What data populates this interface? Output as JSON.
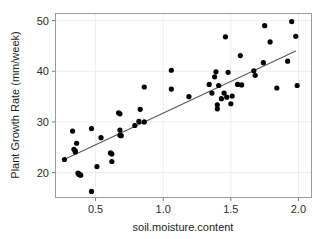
{
  "chart_data": {
    "type": "scatter",
    "title": "",
    "xlabel": "soil.moisture.content",
    "ylabel": "Plant Growth Rate (mm/week)",
    "xlim": [
      0.2,
      2.1
    ],
    "ylim": [
      15.0,
      51.5
    ],
    "xticks": [
      0.5,
      1.0,
      1.5,
      2.0
    ],
    "xtick_labels": [
      "0.5",
      "1.0",
      "1.5",
      "2.0"
    ],
    "yticks": [
      20,
      30,
      40,
      50
    ],
    "ytick_labels": [
      "20",
      "30",
      "40",
      "50"
    ],
    "grid": true,
    "legend": "none",
    "point_color": "#000000",
    "point_size": 2.6,
    "line_color": "#595959",
    "line_width": 1.1,
    "panel_border_color": "#9a9a9a",
    "grid_color": "#ededed",
    "background": "#ffffff",
    "series": [
      {
        "name": "observations",
        "x": [
          0.27,
          0.33,
          0.34,
          0.35,
          0.35,
          0.36,
          0.37,
          0.38,
          0.38,
          0.39,
          0.47,
          0.47,
          0.51,
          0.54,
          0.61,
          0.62,
          0.62,
          0.67,
          0.68,
          0.68,
          0.68,
          0.69,
          0.79,
          0.82,
          0.83,
          0.86,
          0.86,
          1.06,
          1.06,
          1.19,
          1.34,
          1.36,
          1.38,
          1.39,
          1.4,
          1.4,
          1.41,
          1.43,
          1.45,
          1.46,
          1.47,
          1.48,
          1.5,
          1.51,
          1.55,
          1.57,
          1.58,
          1.67,
          1.68,
          1.74,
          1.75,
          1.79,
          1.84,
          1.92,
          1.95,
          1.98,
          1.99
        ],
        "y": [
          22.6,
          28.2,
          24.6,
          24.3,
          24.1,
          25.8,
          19.9,
          19.7,
          19.6,
          19.5,
          28.7,
          16.3,
          21.2,
          26.9,
          23.9,
          23.7,
          22.2,
          31.8,
          31.6,
          28.4,
          27.4,
          27.3,
          29.3,
          30.1,
          32.5,
          36.9,
          30.0,
          40.2,
          36.5,
          35.0,
          37.4,
          35.7,
          38.9,
          39.9,
          33.4,
          32.6,
          37.2,
          34.6,
          35.7,
          46.8,
          34.9,
          39.8,
          33.6,
          35.1,
          37.4,
          43.1,
          37.3,
          40.1,
          39.2,
          41.7,
          49.0,
          45.8,
          36.7,
          42.0,
          49.8,
          46.9,
          37.2
        ]
      }
    ],
    "fit_line": {
      "name": "linear fit",
      "x_start": 0.26,
      "y_start": 22.5,
      "x_end": 1.98,
      "y_end": 44.0
    }
  },
  "axes": {
    "x_axis_name": "soil.moisture.content",
    "y_axis_name": "Plant Growth Rate (mm/week)"
  }
}
